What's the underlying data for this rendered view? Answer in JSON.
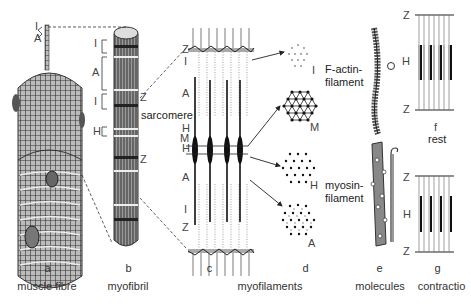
{
  "panels": {
    "a": {
      "letter": "a",
      "caption": "muscle fibre"
    },
    "b": {
      "letter": "b",
      "caption": "myofibril"
    },
    "c": {
      "letter": "c"
    },
    "cd_caption": "myofilaments",
    "d": {
      "letter": "d"
    },
    "e": {
      "letter": "e",
      "caption": "molecules"
    },
    "g": {
      "letter": "g",
      "caption": "contractio"
    }
  },
  "labels": {
    "fibre_I": "I",
    "fibre_A": "A",
    "fib_I1": "I",
    "fib_A": "A",
    "fib_I2": "I",
    "fib_Z1": "Z",
    "fib_H": "H",
    "fib_Z2": "Z",
    "sarcomere": "sarcomere",
    "c_Z_top": "Z",
    "c_I_top": "I",
    "c_A_top": "A",
    "c_H_top": "H",
    "c_M": "M",
    "c_H_bot": "H",
    "c_A_bot": "A",
    "c_I_bot": "I",
    "c_Z_bot": "Z",
    "d_I": "I",
    "d_M": "M",
    "d_H": "H",
    "d_A": "A",
    "actin": "F-actin-\nfilament",
    "actin_l1": "F-actin-",
    "actin_l2": "filament",
    "myosin_l1": "myosin-",
    "myosin_l2": "filament",
    "f_Z_top": "Z",
    "f_H": "H",
    "f_Z_bot": "Z",
    "f_letter": "f",
    "f_state": "rest",
    "g_Z_top": "Z",
    "g_H": "H",
    "g_Z_bot": "Z"
  },
  "colors": {
    "ink": "#222222",
    "shade": "#555555",
    "light": "#999999",
    "background": "#ffffff"
  }
}
